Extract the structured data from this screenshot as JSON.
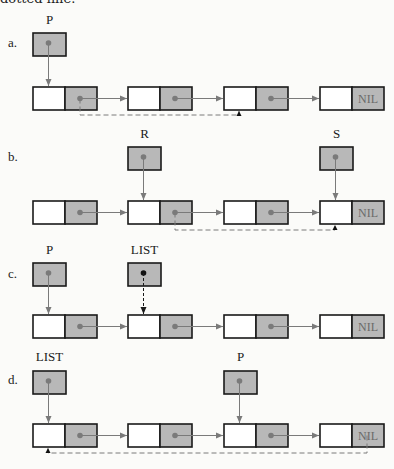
{
  "caption_fragment": "dotted line.",
  "colors": {
    "box_stroke": "#1a1a1a",
    "pointer_fill": "#b8b8b8",
    "dot": "#7a7a7a",
    "arrow": "#7a7a7a",
    "nil_text": "#6a6a6a"
  },
  "nil_label": "NIL",
  "diagrams": [
    {
      "id": "a",
      "row_label": "a.",
      "pointers": [
        {
          "name": "P",
          "target_node": 0
        }
      ],
      "nodes": 4,
      "dashed_link": {
        "from_node": 0,
        "to_node": 2
      }
    },
    {
      "id": "b",
      "row_label": "b.",
      "pointers": [
        {
          "name": "R",
          "target_node": 1
        },
        {
          "name": "S",
          "target_node": 3
        }
      ],
      "nodes": 4,
      "dashed_link": {
        "from_node": 1,
        "to_node": 3
      }
    },
    {
      "id": "c",
      "row_label": "c.",
      "pointers": [
        {
          "name": "P",
          "target_node": 0
        },
        {
          "name": "LIST",
          "target_node": 1,
          "dashed": true
        }
      ],
      "nodes": 4,
      "dashed_link": null
    },
    {
      "id": "d",
      "row_label": "d.",
      "pointers": [
        {
          "name": "LIST",
          "target_node": 0
        },
        {
          "name": "P",
          "target_node": 2
        }
      ],
      "nodes": 4,
      "dashed_link": {
        "from_node": 3,
        "to_node": 0
      }
    }
  ]
}
